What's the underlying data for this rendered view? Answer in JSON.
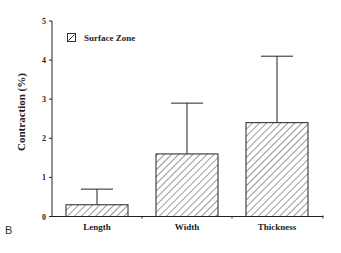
{
  "panel_label": "B",
  "chart_data": {
    "type": "bar",
    "title": "",
    "xlabel": "",
    "ylabel": "Contraction (%)",
    "categories": [
      "Length",
      "Width",
      "Thickness"
    ],
    "series": [
      {
        "name": "Surface Zone",
        "values": [
          0.3,
          1.6,
          2.4
        ],
        "error_upper": [
          0.4,
          1.3,
          1.7
        ],
        "pattern": "diagonal-hatch"
      }
    ],
    "ylim": [
      0,
      5
    ],
    "yticks": [
      0,
      1,
      2,
      3,
      4,
      5
    ],
    "grid": false,
    "legend": {
      "position": "top-left",
      "entries": [
        "Surface Zone"
      ]
    }
  },
  "colors": {
    "ink": "#222222",
    "background": "#ffffff"
  }
}
